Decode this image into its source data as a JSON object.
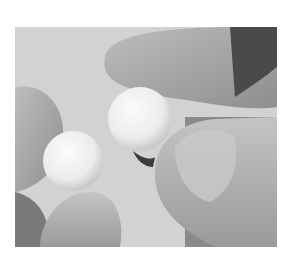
{
  "image": {
    "alt": "Grayscale photo of fingers holding two small white spheres",
    "background": "#ffffff",
    "palette": {
      "bg": "#d2d2d2",
      "skin_light": "#b8b8b8",
      "skin_mid": "#9c9c9c",
      "skin_dark": "#6e6e6e",
      "shadow": "#3c3c3c",
      "sphere": "#f2f2f2"
    }
  }
}
